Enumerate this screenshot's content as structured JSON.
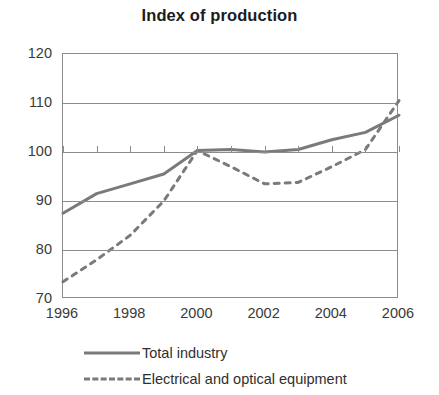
{
  "chart_data": {
    "type": "line",
    "title": "Index of production",
    "xlabel": "",
    "ylabel": "",
    "xlim": [
      1996,
      2006
    ],
    "ylim": [
      70,
      120
    ],
    "yticks": [
      70,
      80,
      90,
      100,
      110,
      120
    ],
    "xticks": [
      1996,
      1997,
      1998,
      1999,
      2000,
      2001,
      2002,
      2003,
      2004,
      2005,
      2006
    ],
    "xtick_labels": [
      "1996",
      "1998",
      "2000",
      "2002",
      "2004",
      "2006"
    ],
    "xtick_labels_years": [
      1996,
      1998,
      2000,
      2002,
      2004,
      2006
    ],
    "grid": true,
    "legend_position": "bottom",
    "x": [
      1996,
      1997,
      1998,
      1999,
      2000,
      2001,
      2002,
      2003,
      2004,
      2005,
      2006
    ],
    "series": [
      {
        "name": "Total industry",
        "style": "solid",
        "color": "#7a7a7a",
        "values": [
          87.5,
          91.5,
          93.5,
          95.5,
          100.3,
          100.5,
          100.0,
          100.5,
          102.5,
          104.0,
          107.5
        ]
      },
      {
        "name": "Electrical and optical equipment",
        "style": "dashed",
        "color": "#7a7a7a",
        "values": [
          73.5,
          78.0,
          83.0,
          90.0,
          100.3,
          97.0,
          93.5,
          93.8,
          97.0,
          100.5,
          110.5
        ]
      }
    ]
  },
  "axis": {
    "y_labels": [
      "120",
      "110",
      "100",
      "90",
      "80",
      "70"
    ],
    "y_values": [
      120,
      110,
      100,
      90,
      80,
      70
    ],
    "x_labels": [
      "1996",
      "1998",
      "2000",
      "2002",
      "2004",
      "2006"
    ],
    "x_values": [
      1996,
      1998,
      2000,
      2002,
      2004,
      2006
    ]
  },
  "legend": {
    "items": [
      {
        "label": "Total industry",
        "style": "solid",
        "color": "#7a7a7a"
      },
      {
        "label": "Electrical and optical equipment",
        "style": "dashed",
        "color": "#7a7a7a"
      }
    ]
  },
  "colors": {
    "line": "#7a7a7a",
    "axis": "#8c8c8c",
    "text": "#333333",
    "background": "#ffffff"
  }
}
